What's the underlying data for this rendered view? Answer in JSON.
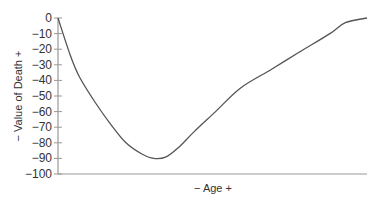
{
  "chart_data": {
    "type": "line",
    "title": "",
    "xlabel": "− Age +",
    "ylabel": "− Value of Death +",
    "ylim": [
      -100,
      0
    ],
    "xlim": [
      0,
      100
    ],
    "x_ticks_shown": false,
    "grid": false,
    "legend": null,
    "y_ticks": [
      0,
      -10,
      -20,
      -30,
      -40,
      -50,
      -60,
      -70,
      -80,
      -90,
      -100
    ],
    "y_tick_labels": [
      "0",
      "−10",
      "−20",
      "−30",
      "−40",
      "−50",
      "−60",
      "−70",
      "−80",
      "−90",
      "−100"
    ],
    "series": [
      {
        "name": "Value of Death",
        "color": "#555555",
        "x": [
          0,
          4,
          7,
          12,
          17,
          22,
          27,
          31,
          35,
          39,
          44,
          51,
          59,
          69,
          78,
          88,
          93,
          100
        ],
        "values": [
          0,
          -24,
          -38,
          -54,
          -68,
          -80,
          -87,
          -90,
          -89,
          -83,
          -73,
          -60,
          -45,
          -33,
          -22,
          -10,
          -3,
          0
        ]
      }
    ]
  },
  "colors": {
    "line": "#555555",
    "axis": "#999999",
    "text": "#333333"
  }
}
